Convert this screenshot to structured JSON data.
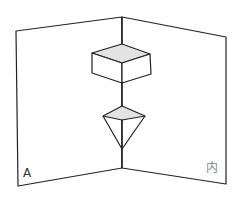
{
  "diagram": {
    "labels": {
      "left": "A",
      "right": "内"
    },
    "colors": {
      "line": "#222222",
      "fill": "#e3e3e3",
      "right_label": "#888888",
      "left_label": "#333333"
    }
  }
}
